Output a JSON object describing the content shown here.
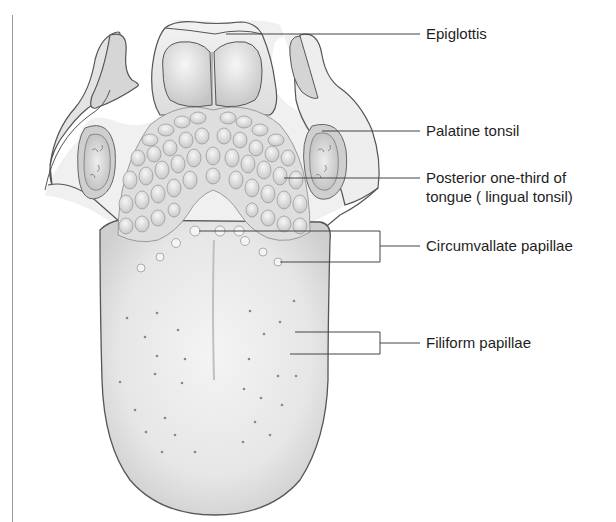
{
  "diagram": {
    "labels": [
      {
        "id": "epiglottis",
        "text": "Epiglottis"
      },
      {
        "id": "palatine-tonsil",
        "text": "Palatine tonsil"
      },
      {
        "id": "posterior-third",
        "line1": "Posterior one-third of",
        "line2": "tongue ( lingual tonsil)"
      },
      {
        "id": "circumvallate",
        "text": "Circumvallate papillae"
      },
      {
        "id": "filiform",
        "text": "Filiform papillae"
      }
    ],
    "colors": {
      "outline": "#555555",
      "leader_line": "#444444",
      "tongue_fill": "#ececec",
      "shadow": "#c8c8c8",
      "text": "#1e1e1e"
    }
  }
}
